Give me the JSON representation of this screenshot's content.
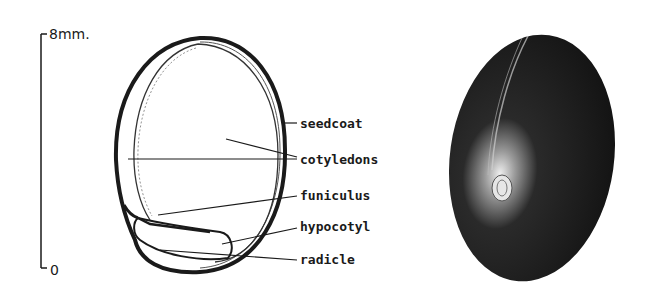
{
  "scale_bar": {
    "top_label": "8mm.",
    "bottom_label": "0"
  },
  "cross_section": {
    "labels": [
      "seedcoat",
      "cotyledons",
      "funiculus",
      "hypocotyl",
      "radicle"
    ]
  },
  "colors": {
    "ink": "#1a1a1a",
    "background": "#ffffff",
    "seed_dark": "#161616"
  }
}
